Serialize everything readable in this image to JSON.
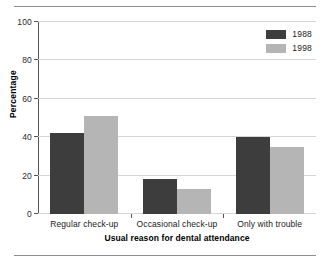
{
  "chart_data": {
    "type": "bar",
    "title": "",
    "xlabel": "Usual reason for dental attendance",
    "ylabel": "Percentage",
    "categories": [
      "Regular check-up",
      "Occasional check-up",
      "Only with trouble"
    ],
    "series": [
      {
        "name": "1988",
        "values": [
          42,
          18,
          40
        ],
        "color": "#3d3d3d"
      },
      {
        "name": "1998",
        "values": [
          51,
          13,
          35
        ],
        "color": "#b5b5b5"
      }
    ],
    "ylim": [
      0,
      100
    ],
    "yticks": [
      0,
      20,
      40,
      60,
      80,
      100
    ],
    "ytick_labels": [
      "0",
      "20",
      "40",
      "60",
      "80",
      "100"
    ],
    "grid": true,
    "legend_position": "top-right"
  }
}
